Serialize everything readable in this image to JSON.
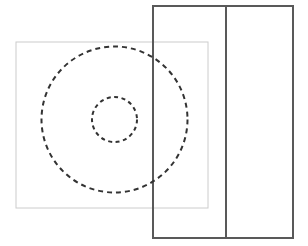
{
  "canvas": {
    "width": 308,
    "height": 246,
    "background_color": "#ffffff"
  },
  "figure": {
    "shapes": [
      {
        "name": "outer-rectangle",
        "kind": "rectangle",
        "x": 153,
        "y": 6,
        "width": 140,
        "height": 232,
        "stroke_color": "#595959",
        "stroke_width": 2,
        "stroke_style": "solid",
        "fill": "none"
      },
      {
        "name": "rectangle-divider-line",
        "kind": "line",
        "x1": 226,
        "y1": 6,
        "x2": 226,
        "y2": 238,
        "stroke_color": "#595959",
        "stroke_width": 2,
        "stroke_style": "solid"
      },
      {
        "name": "light-square",
        "kind": "rectangle",
        "x": 16,
        "y": 42,
        "width": 192,
        "height": 166,
        "stroke_color": "#cccccc",
        "stroke_width": 1,
        "stroke_style": "solid",
        "fill": "none"
      },
      {
        "name": "outer-dashed-circle",
        "kind": "circle",
        "cx": 114.5,
        "cy": 119.5,
        "r": 73,
        "stroke_color": "#333333",
        "stroke_width": 2,
        "stroke_style": "dashed",
        "dash_pattern": "5 4",
        "fill": "none"
      },
      {
        "name": "inner-dashed-circle",
        "kind": "circle",
        "cx": 114.5,
        "cy": 119.5,
        "r": 22.5,
        "stroke_color": "#333333",
        "stroke_width": 2,
        "stroke_style": "dashed",
        "dash_pattern": "4 3.5",
        "fill": "none"
      }
    ],
    "colors": {
      "dark_stroke": "#595959",
      "dashed_stroke": "#333333",
      "light_stroke": "#cccccc",
      "background": "#ffffff"
    }
  }
}
